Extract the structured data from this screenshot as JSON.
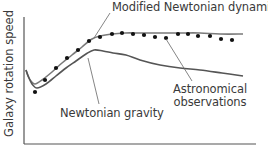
{
  "chart_data": {
    "type": "line",
    "title": "",
    "xlabel": "",
    "ylabel": "Galaxy rotation speed",
    "grid": false,
    "x_ticks": [],
    "y_ticks": [],
    "annotations": [
      {
        "text": "Modified Newtonian dynamics",
        "target": "mond-curve"
      },
      {
        "text": "Newtonian gravity",
        "target": "newtonian-curve"
      },
      {
        "text": "Astronomical observations",
        "target": "observation-points"
      }
    ],
    "series": [
      {
        "name": "Modified Newtonian dynamics",
        "style": "line",
        "color": "#7a7a7a",
        "points": [
          [
            26,
            70
          ],
          [
            28,
            76
          ],
          [
            31,
            81
          ],
          [
            35,
            84
          ],
          [
            42,
            80
          ],
          [
            52,
            72
          ],
          [
            62,
            63
          ],
          [
            72,
            55
          ],
          [
            82,
            47
          ],
          [
            92,
            39
          ],
          [
            100,
            36
          ],
          [
            112,
            34
          ],
          [
            125,
            33
          ],
          [
            140,
            33
          ],
          [
            160,
            33
          ],
          [
            180,
            33
          ],
          [
            200,
            33
          ],
          [
            220,
            34
          ],
          [
            243,
            34
          ]
        ]
      },
      {
        "name": "Newtonian gravity",
        "style": "line",
        "color": "#555555",
        "points": [
          [
            26,
            70
          ],
          [
            29,
            78
          ],
          [
            32,
            84
          ],
          [
            37,
            88
          ],
          [
            46,
            84
          ],
          [
            56,
            76
          ],
          [
            66,
            68
          ],
          [
            76,
            61
          ],
          [
            86,
            54
          ],
          [
            94,
            50
          ],
          [
            103,
            51
          ],
          [
            113,
            53
          ],
          [
            126,
            55
          ],
          [
            140,
            60
          ],
          [
            160,
            65
          ],
          [
            180,
            68
          ],
          [
            200,
            70
          ],
          [
            222,
            73
          ],
          [
            243,
            76
          ]
        ]
      },
      {
        "name": "Astronomical observations",
        "style": "scatter",
        "color": "#111111",
        "points": [
          [
            35,
            92
          ],
          [
            45,
            80
          ],
          [
            56,
            68
          ],
          [
            67,
            58
          ],
          [
            78,
            50
          ],
          [
            89,
            41
          ],
          [
            100,
            37
          ],
          [
            112,
            34
          ],
          [
            122,
            33
          ],
          [
            133,
            34
          ],
          [
            144,
            35
          ],
          [
            155,
            37
          ],
          [
            166,
            38
          ],
          [
            178,
            34
          ],
          [
            188,
            34
          ],
          [
            198,
            36
          ],
          [
            210,
            36
          ],
          [
            221,
            39
          ],
          [
            232,
            40
          ]
        ]
      }
    ],
    "xlim": [
      24,
      256
    ],
    "ylim_px": [
      17,
      144
    ]
  },
  "labels": {
    "ylabel": "Galaxy rotation speed",
    "mond": "Modified Newtonian dynamics",
    "newton": "Newtonian gravity",
    "obs_line1": "Astronomical",
    "obs_line2": "observations"
  },
  "colors": {
    "axis": "#555555",
    "mond": "#7a7a7a",
    "newton": "#555555",
    "dots": "#111111",
    "leader": "#666666",
    "text": "#3a3a3a"
  }
}
